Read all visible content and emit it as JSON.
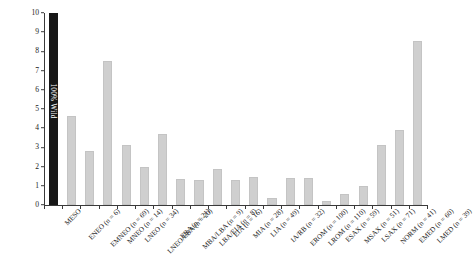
{
  "chart_data": {
    "type": "bar",
    "title": "",
    "xlabel": "",
    "ylabel": "Percentage Representation",
    "ylim": [
      0,
      10
    ],
    "ytick_labels": [
      "0",
      "1",
      "2",
      "3",
      "4",
      "5",
      "6",
      "7",
      "8",
      "9",
      "10"
    ],
    "grid": false,
    "legend": null,
    "annotations": [
      {
        "text": "100% Wild",
        "category": "MESO",
        "orientation": "vertical",
        "color": "#ffffff"
      }
    ],
    "series": [
      {
        "name": "Percentage Representation",
        "color": "#cfcfcf",
        "highlight_color": "#171717"
      }
    ],
    "categories": [
      "MESO",
      "ENEO (n = 6)",
      "EMNEO (n = 69)",
      "MNEO (n = 14)",
      "LNEO (n = 34)",
      "LNEO/EBA (n = 20)",
      "EBA (n = 21)",
      "MBA/LBA (n = 9)",
      "LBA/EIA (n = 8)",
      "EIA (n = 16)",
      "MIA (n = 28)",
      "LIA (n = 49)",
      "IA/RB (n = 32)",
      "EROM (n = 100)",
      "LROM (n = 110)",
      "ESAX (n = 59)",
      "MSAX (n = 51)",
      "LSAX (n = 71)",
      "NORM (n = 41)",
      "EMED (n = 60)",
      "LMED (n = 39)"
    ],
    "values": [
      10.0,
      4.65,
      2.8,
      7.5,
      3.1,
      2.0,
      3.7,
      1.35,
      1.3,
      1.9,
      1.3,
      1.45,
      0.35,
      1.4,
      1.4,
      0.2,
      0.55,
      1.0,
      3.1,
      3.9,
      8.55
    ],
    "highlight_index": 0
  }
}
